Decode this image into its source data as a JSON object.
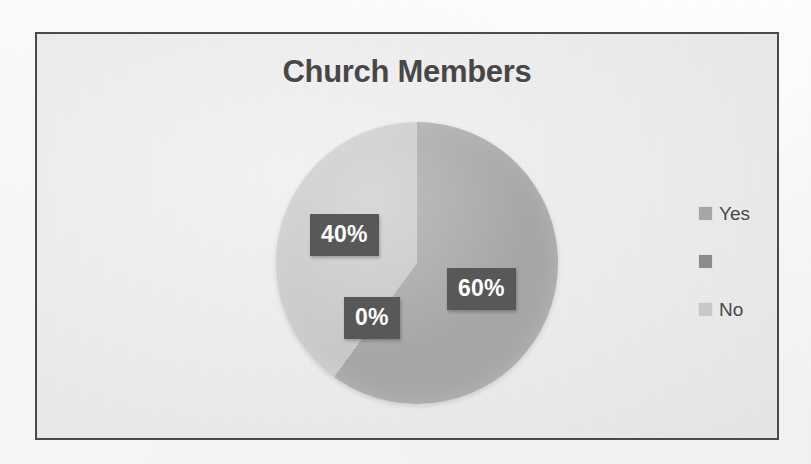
{
  "page": {
    "background_color": "#fbfbfb",
    "frame_border_color": "#4a4a4a",
    "plot_background_color": "#ededed"
  },
  "ghost_text": {
    "left": "",
    "right": ""
  },
  "chart_data": {
    "type": "pie",
    "title": "Church Members",
    "xlabel": "",
    "ylabel": "",
    "legend_position": "right",
    "grid": false,
    "categories": [
      "Yes",
      "",
      "No"
    ],
    "values": [
      60,
      0,
      40
    ],
    "value_labels": [
      "60%",
      "0%",
      "40%"
    ],
    "slices": [
      {
        "name": "Yes",
        "value": 60,
        "label": "60%",
        "color": "#a6a6a6",
        "legend_label": "Yes",
        "start_angle_deg": 0,
        "end_angle_deg": 216
      },
      {
        "name": "",
        "value": 0,
        "label": "0%",
        "color": "#8c8c8c",
        "legend_label": "",
        "start_angle_deg": 216,
        "end_angle_deg": 216
      },
      {
        "name": "No",
        "value": 40,
        "label": "40%",
        "color": "#c8c8c8",
        "legend_label": "No",
        "start_angle_deg": 216,
        "end_angle_deg": 360
      }
    ],
    "data_label_background": "#585858",
    "data_label_color": "#ffffff",
    "title_color": "#474747"
  },
  "legend": {
    "items": [
      {
        "label": "Yes",
        "color": "#a6a6a6"
      },
      {
        "label": "",
        "color": "#8c8c8c"
      },
      {
        "label": "No",
        "color": "#c8c8c8"
      }
    ]
  }
}
